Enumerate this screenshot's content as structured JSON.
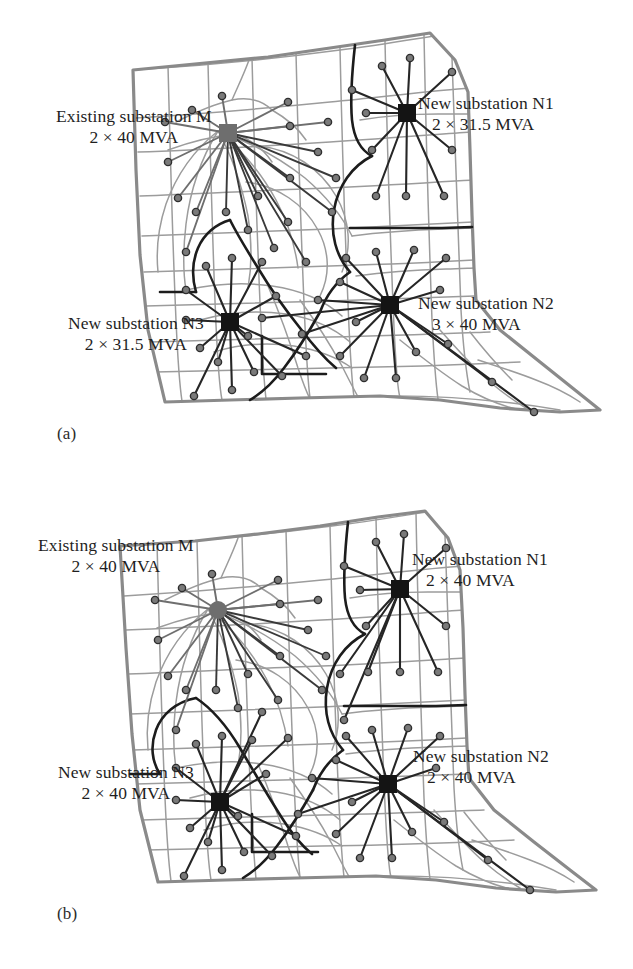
{
  "figure": {
    "type": "two-panel-map"
  },
  "panels": [
    {
      "id": "a",
      "caption": "(a)",
      "labels": [
        {
          "name": "existing-substation-m",
          "title": "Existing substation M",
          "capacity": "2 × 40 MVA",
          "marker": "gray-square"
        },
        {
          "name": "new-substation-n1",
          "title": "New substation N1",
          "capacity": "2 × 31.5 MVA",
          "marker": "black-square"
        },
        {
          "name": "new-substation-n2",
          "title": "New substation N2",
          "capacity": "3 × 40 MVA",
          "marker": "black-square"
        },
        {
          "name": "new-substation-n3",
          "title": "New substation N3",
          "capacity": "2 × 31.5 MVA",
          "marker": "black-square"
        }
      ]
    },
    {
      "id": "b",
      "caption": "(b)",
      "labels": [
        {
          "name": "existing-substation-m",
          "title": "Existing substation M",
          "capacity": "2 × 40 MVA",
          "marker": "gray-square"
        },
        {
          "name": "new-substation-n1",
          "title": "New substation N1",
          "capacity": "2 × 40 MVA",
          "marker": "black-square"
        },
        {
          "name": "new-substation-n2",
          "title": "New substation N2",
          "capacity": "2 × 40 MVA",
          "marker": "black-square"
        },
        {
          "name": "new-substation-n3",
          "title": "New substation N3",
          "capacity": "2 × 40 MVA",
          "marker": "black-square"
        }
      ]
    }
  ],
  "colors": {
    "background": "#ffffff",
    "area_boundary": "#8a8a8a",
    "street_grid": "#9a9a9a",
    "territory_boundary": "#1c1c1c",
    "feeder_dark": "#2a2a2a",
    "feeder_gray": "#6e6e6e",
    "load_point_fill": "#6b6b6b",
    "substation_existing": "#6e6e6e",
    "substation_new": "#141414",
    "text": "#1f1f1f"
  }
}
